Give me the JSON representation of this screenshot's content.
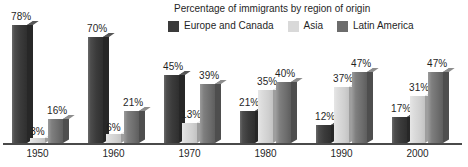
{
  "chart_data": {
    "type": "bar",
    "title": "Percentage of immigrants by region of origin",
    "xlabel": "",
    "ylabel": "",
    "ylim": [
      0,
      80
    ],
    "grid": false,
    "legend_position": "top-right",
    "value_suffix": "%",
    "categories": [
      "1950",
      "1960",
      "1970",
      "1980",
      "1990",
      "2000"
    ],
    "series": [
      {
        "name": "Europe and Canada",
        "color": "#3b3b3b",
        "values": [
          78,
          70,
          45,
          21,
          12,
          17
        ],
        "labels": [
          "78%",
          "70%",
          "45%",
          "21%",
          "12%",
          "17%"
        ]
      },
      {
        "name": "Asia",
        "color": "#d2d2d2",
        "values": [
          3,
          6,
          13,
          35,
          37,
          31
        ],
        "labels": [
          "3%",
          "6%",
          "13%",
          "35%",
          "37%",
          "31%"
        ]
      },
      {
        "name": "Latin America",
        "color": "#6c6c6c",
        "values": [
          16,
          21,
          39,
          40,
          47,
          47
        ],
        "labels": [
          "16%",
          "21%",
          "39%",
          "40%",
          "47%",
          "47%"
        ]
      }
    ]
  },
  "legend": {
    "items": [
      {
        "label": "Europe and Canada",
        "swatch": "#3b3b3b"
      },
      {
        "label": "Asia",
        "swatch": "#d9d9d9"
      },
      {
        "label": "Latin America",
        "swatch": "#6c6c6c"
      }
    ]
  },
  "axis": {
    "tick_labels": [
      "1950",
      "1960",
      "1970",
      "1980",
      "1990",
      "2000"
    ]
  }
}
